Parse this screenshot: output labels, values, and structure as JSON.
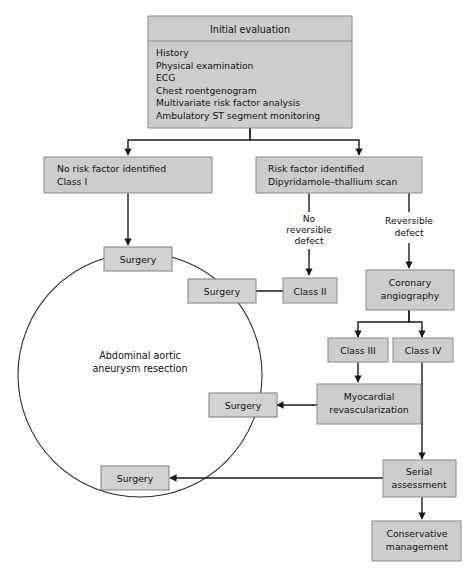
{
  "diagram": {
    "colors": {
      "box_fill": "#cdcdcd",
      "box_stroke": "#8a8a8a",
      "connector": "#1a1a1a",
      "text": "#14100e",
      "background": "#ffffff"
    },
    "initial_evaluation": {
      "header": "Initial evaluation",
      "items": [
        "History",
        "Physical examination",
        "ECG",
        "Chest roentgenogram",
        "Multivariate risk factor analysis",
        "Ambulatory ST segment monitoring"
      ]
    },
    "branch_left": {
      "line1": "No risk factor identified",
      "line2": "Class I"
    },
    "branch_right": {
      "line1": "Risk factor identified",
      "line2": "Dipyridamole–thallium scan"
    },
    "edge_labels": {
      "no_reversible_defect": [
        "No",
        "reversible",
        "defect"
      ],
      "reversible_defect": [
        "Reversible",
        "defect"
      ]
    },
    "circle_label": {
      "line1": "Abdominal aortic",
      "line2": "aneurysm resection"
    },
    "nodes": {
      "surgery_top": "Surgery",
      "surgery_upper_right": "Surgery",
      "surgery_mid_right": "Surgery",
      "surgery_bottom": "Surgery",
      "class_2": "Class II",
      "coronary_angiography": [
        "Coronary",
        "angiography"
      ],
      "class_3": "Class III",
      "class_4": "Class IV",
      "myocardial_revascularization": [
        "Myocardial",
        "revascularization"
      ],
      "serial_assessment": [
        "Serial",
        "assessment"
      ],
      "conservative_management": [
        "Conservative",
        "management"
      ]
    }
  }
}
